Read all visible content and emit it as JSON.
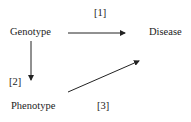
{
  "nodes": {
    "genotype": "Genotype",
    "disease": "Disease",
    "phenotype": "Phenotype"
  },
  "edges": [
    {
      "from": "Genotype",
      "to": "Disease",
      "label": "[1]"
    },
    {
      "from": "Genotype",
      "to": "Phenotype",
      "label": "[2]"
    },
    {
      "from": "Phenotype",
      "to": "Disease",
      "label": "[3]"
    }
  ]
}
